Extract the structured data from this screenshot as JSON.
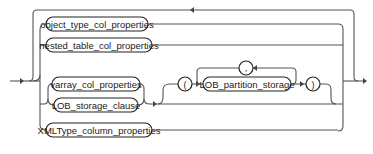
{
  "diagram": {
    "type": "railroad-syntax-diagram",
    "nodes": {
      "object_type": "object_type_col_properties",
      "nested_table": "nested_table_col_properties",
      "varray": "varray_col_properties",
      "lob_storage": "LOB_storage_clause",
      "open_paren": "(",
      "lob_partition": "LOB_partition_storage",
      "comma": ",",
      "close_paren": ")",
      "xmltype": "XMLType_column_properties"
    },
    "colors": {
      "line": "#555555",
      "pill_border": "#222222",
      "text": "#222222",
      "background": "#ffffff"
    }
  }
}
